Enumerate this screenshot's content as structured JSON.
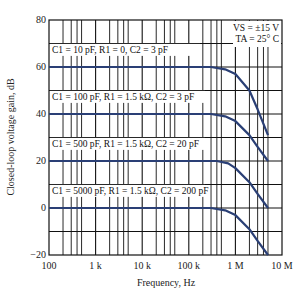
{
  "chart_data": {
    "type": "line",
    "title": "",
    "xlabel": "Frequency, Hz",
    "ylabel": "Closed-loop voltage gain, dB",
    "xscale": "log",
    "xlim": [
      100,
      10000000
    ],
    "ylim": [
      -20,
      80
    ],
    "grid": true,
    "x_ticks": [
      {
        "value": 100,
        "label": "100"
      },
      {
        "value": 1000,
        "label": "1 k"
      },
      {
        "value": 10000,
        "label": "10 k"
      },
      {
        "value": 100000,
        "label": "100 k"
      },
      {
        "value": 1000000,
        "label": "1 M"
      },
      {
        "value": 10000000,
        "label": "10 M"
      }
    ],
    "y_ticks": [
      {
        "value": 80,
        "label": "80"
      },
      {
        "value": 60,
        "label": "60"
      },
      {
        "value": 40,
        "label": "40"
      },
      {
        "value": 20,
        "label": "20"
      },
      {
        "value": 0,
        "label": "0"
      },
      {
        "value": -20,
        "label": "−20"
      }
    ],
    "conditions": [
      "VS = ±15 V",
      "TA = 25° C"
    ],
    "series": [
      {
        "name": "C1 = 10 pF, R1 = 0, C2 = 3 pF",
        "gain_db": 60,
        "x": [
          100,
          300000,
          600000,
          1000000,
          2000000,
          3000000,
          5000000
        ],
        "y": [
          60,
          60,
          59,
          57,
          50,
          42,
          31
        ]
      },
      {
        "name": "C1 = 100 pF, R1 = 1.5 kΩ, C2 = 3 pF",
        "gain_db": 40,
        "x": [
          100,
          300000,
          600000,
          1000000,
          2000000,
          3000000,
          5000000
        ],
        "y": [
          40,
          40,
          39,
          37,
          31,
          26,
          20
        ]
      },
      {
        "name": "C1 = 500 pF, R1 = 1.5 kΩ, C2 = 20 pF",
        "gain_db": 20,
        "x": [
          100,
          400000,
          700000,
          1000000,
          2000000,
          3000000,
          5000000
        ],
        "y": [
          20,
          20,
          19,
          17,
          11,
          6,
          0
        ]
      },
      {
        "name": "C1 = 5000 pF, R1 = 1.5 kΩ, C2 = 200 pF",
        "gain_db": 0,
        "x": [
          100,
          300000,
          600000,
          1000000,
          2000000,
          3000000,
          5000000
        ],
        "y": [
          0,
          0,
          -1,
          -3,
          -9,
          -14,
          -20
        ]
      }
    ],
    "colors": {
      "curve": "#2a3f75",
      "grid": "#111111"
    }
  }
}
